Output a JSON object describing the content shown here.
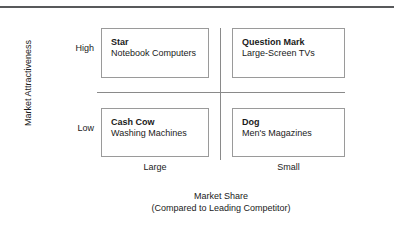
{
  "chart_data": {
    "type": "table",
    "title": "",
    "xlabel": "Market Share",
    "xlabel_sub": "(Compared to Leading Competitor)",
    "ylabel": "Market Attractiveness",
    "x_ticks": [
      "Large",
      "Small"
    ],
    "y_ticks": [
      "High",
      "Low"
    ],
    "grid": false,
    "legend": "none",
    "quadrants": [
      {
        "id": "star",
        "title": "Star",
        "example": "Notebook Computers",
        "market_share": "Large",
        "market_attractiveness": "High"
      },
      {
        "id": "question-mark",
        "title": "Question Mark",
        "example": "Large-Screen TVs",
        "market_share": "Small",
        "market_attractiveness": "High"
      },
      {
        "id": "cash-cow",
        "title": "Cash Cow",
        "example": "Washing Machines",
        "market_share": "Large",
        "market_attractiveness": "Low"
      },
      {
        "id": "dog",
        "title": "Dog",
        "example": "Men's Magazines",
        "market_share": "Small",
        "market_attractiveness": "Low"
      }
    ]
  },
  "colors": {
    "rule": "#58595b",
    "divider": "#8a8a8a",
    "box_border": "#9a9a9a",
    "text": "#1a1a1a",
    "background": "#ffffff"
  }
}
